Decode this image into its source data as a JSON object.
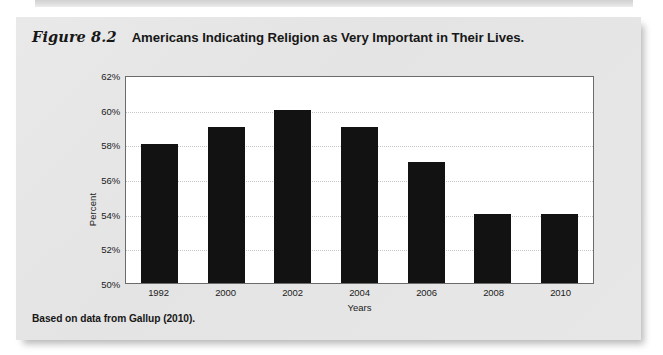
{
  "figure": {
    "number": "Figure 8.2",
    "title": "Americans Indicating Religion as Very Important in Their Lives.",
    "source": "Based on data from Gallup (2010)."
  },
  "chart_data": {
    "type": "bar",
    "title": "Americans Indicating Religion as Very Important in Their Lives.",
    "categories": [
      "1992",
      "2000",
      "2002",
      "2004",
      "2006",
      "2008",
      "2010"
    ],
    "values": [
      58,
      59,
      60,
      59,
      57,
      54,
      54
    ],
    "value_labels": [
      "58%",
      "59%",
      "60%",
      "59%",
      "57%",
      "54%",
      "54%"
    ],
    "xlabel": "Years",
    "ylabel": "Percent",
    "ylim": [
      50,
      62
    ],
    "ytick_step": 2,
    "ytick_labels": [
      "50%",
      "52%",
      "54%",
      "56%",
      "58%",
      "60%",
      "62%"
    ],
    "ytick_values": [
      50,
      52,
      54,
      56,
      58,
      60,
      62
    ],
    "grid": "horizontal-dotted",
    "legend": "none",
    "bar_color": "#121212",
    "plot_background": "#ffffff",
    "panel_background": "#e6e6e6"
  }
}
